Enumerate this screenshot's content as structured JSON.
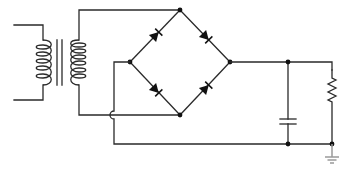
{
  "diagram": {
    "type": "full-wave bridge rectifier circuit",
    "colors": {
      "wire": "#2a2a2a",
      "node": "#111111",
      "ground": "#9a9a9a",
      "background": "#ffffff"
    },
    "components": [
      {
        "id": "transformer",
        "kind": "transformer",
        "primary_turns": 5,
        "secondary_turns": 6,
        "core_lines": 2
      },
      {
        "id": "D1",
        "kind": "diode",
        "position": "bridge-upper-left"
      },
      {
        "id": "D2",
        "kind": "diode",
        "position": "bridge-upper-right"
      },
      {
        "id": "D3",
        "kind": "diode",
        "position": "bridge-lower-left"
      },
      {
        "id": "D4",
        "kind": "diode",
        "position": "bridge-lower-right"
      },
      {
        "id": "C1",
        "kind": "capacitor",
        "position": "filter"
      },
      {
        "id": "R1",
        "kind": "resistor",
        "position": "load"
      },
      {
        "id": "GND",
        "kind": "ground"
      }
    ],
    "nodes": [
      {
        "id": "bridge-top",
        "x": 180,
        "y": 10
      },
      {
        "id": "bridge-left",
        "x": 130,
        "y": 62
      },
      {
        "id": "bridge-right",
        "x": 230,
        "y": 62
      },
      {
        "id": "bridge-bottom",
        "x": 180,
        "y": 115
      },
      {
        "id": "cap-top",
        "x": 288,
        "y": 62
      },
      {
        "id": "cap-bottom",
        "x": 288,
        "y": 144
      },
      {
        "id": "load-bottom",
        "x": 332,
        "y": 144
      }
    ],
    "crossover": {
      "x": 114,
      "y": 115
    }
  }
}
